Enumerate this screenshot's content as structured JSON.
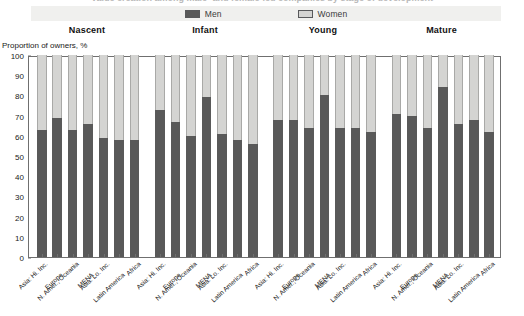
{
  "title": "Value creation among male- and female-led companies by stage of development",
  "legend": {
    "position": "top-center",
    "entries": [
      {
        "label": "Men",
        "color": "#595959",
        "key": "men"
      },
      {
        "label": "Women",
        "color": "#d4d4d2",
        "key": "women"
      }
    ]
  },
  "axis": {
    "ylabel": "Proportion of owners, %",
    "yticks": [
      0,
      10,
      20,
      30,
      40,
      50,
      60,
      70,
      80,
      90,
      100
    ],
    "ylim": [
      0,
      100
    ]
  },
  "stages": [
    {
      "name": "Nascent"
    },
    {
      "name": "Infant"
    },
    {
      "name": "Young"
    },
    {
      "name": "Mature"
    }
  ],
  "chart_data": {
    "type": "bar",
    "subtype": "stacked-100-percent",
    "title": "Value creation among male- and female-led companies by stage of development",
    "xlabel": "",
    "ylabel": "Proportion of owners, %",
    "ylim": [
      0,
      100
    ],
    "yticks": [
      0,
      10,
      20,
      30,
      40,
      50,
      60,
      70,
      80,
      90,
      100
    ],
    "grid": false,
    "legend": [
      "Men",
      "Women"
    ],
    "legend_position": "top-center",
    "group_labels": [
      "Nascent",
      "Infant",
      "Young",
      "Mature"
    ],
    "categories": [
      "Asia: Hi. Inc.",
      "Europe",
      "N. Amer., Oceania",
      "MENA",
      "Asia: Lo. Inc.",
      "Latin America",
      "Africa"
    ],
    "groups": [
      {
        "name": "Nascent",
        "series": [
          {
            "name": "Men",
            "values": [
              63,
              69,
              63,
              66,
              59,
              58,
              58
            ]
          },
          {
            "name": "Women",
            "values": [
              37,
              31,
              37,
              34,
              41,
              42,
              42
            ]
          }
        ]
      },
      {
        "name": "Infant",
        "series": [
          {
            "name": "Men",
            "values": [
              73,
              67,
              60,
              79,
              61,
              58,
              56
            ]
          },
          {
            "name": "Women",
            "values": [
              27,
              33,
              40,
              21,
              39,
              42,
              44
            ]
          }
        ]
      },
      {
        "name": "Young",
        "series": [
          {
            "name": "Men",
            "values": [
              68,
              68,
              64,
              80,
              64,
              64,
              62
            ]
          },
          {
            "name": "Women",
            "values": [
              32,
              32,
              36,
              20,
              36,
              36,
              38
            ]
          }
        ]
      },
      {
        "name": "Mature",
        "series": [
          {
            "name": "Men",
            "values": [
              71,
              70,
              64,
              84,
              66,
              68,
              62
            ]
          },
          {
            "name": "Women",
            "values": [
              29,
              30,
              36,
              16,
              34,
              32,
              38
            ]
          }
        ]
      }
    ]
  }
}
